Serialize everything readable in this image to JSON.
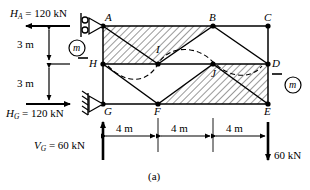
{
  "figure": {
    "caption": "(a)",
    "kN_unit": "kN",
    "meter_unit": "m"
  },
  "reactions": {
    "HA": {
      "symbol": "H",
      "subscript": "A",
      "equals": "=",
      "value": "120",
      "unit": "kN",
      "text": "H_A = 120 kN",
      "direction": "left"
    },
    "HG": {
      "symbol": "H",
      "subscript": "G",
      "equals": "=",
      "value": "120",
      "unit": "kN",
      "text": "H_G = 120 kN",
      "direction": "right"
    },
    "VG": {
      "symbol": "V",
      "subscript": "G",
      "equals": "=",
      "value": "60",
      "unit": "kN",
      "text": "V_G = 60 kN",
      "direction": "up"
    },
    "load_right": {
      "value": "60",
      "unit": "kN",
      "text": "60 kN",
      "direction": "down"
    }
  },
  "vertical_dimensions": [
    {
      "label": "3 m"
    },
    {
      "label": "3 m"
    }
  ],
  "horizontal_dimensions": [
    {
      "label": "4 m"
    },
    {
      "label": "4 m"
    },
    {
      "label": "4 m"
    }
  ],
  "section_markers": [
    {
      "label": "m",
      "position": "left"
    },
    {
      "label": "m",
      "position": "right"
    }
  ],
  "joints": [
    {
      "name": "A",
      "x": 0,
      "y": 6
    },
    {
      "name": "B",
      "x": 8,
      "y": 6
    },
    {
      "name": "C",
      "x": 12,
      "y": 6
    },
    {
      "name": "H",
      "x": 0,
      "y": 3
    },
    {
      "name": "I",
      "x": 4,
      "y": 3
    },
    {
      "name": "J",
      "x": 8,
      "y": 3
    },
    {
      "name": "D",
      "x": 12,
      "y": 3
    },
    {
      "name": "G",
      "x": 0,
      "y": 0
    },
    {
      "name": "F",
      "x": 4,
      "y": 0
    },
    {
      "name": "E",
      "x": 12,
      "y": 0
    }
  ],
  "supports": [
    {
      "at": "A",
      "type": "roller"
    },
    {
      "at": "G",
      "type": "pin"
    }
  ],
  "annotations": {
    "deflection_curve": "dashed S-curve through H, I, J, D",
    "hatching": "cross-hatched panels"
  }
}
